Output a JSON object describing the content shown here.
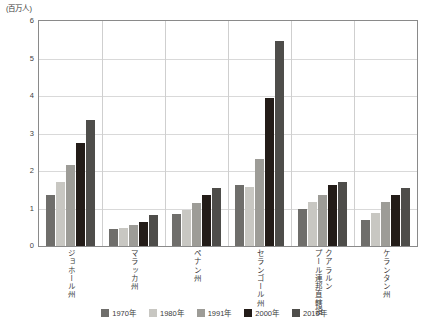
{
  "chart_data": {
    "type": "bar",
    "title": "",
    "subtitle": "",
    "unit_label": "(百万人)",
    "xlabel": "",
    "ylabel": "",
    "ylim": [
      0,
      6
    ],
    "yticks": [
      0,
      1,
      2,
      3,
      4,
      5,
      6
    ],
    "ytick_labels": [
      "0",
      "1",
      "2",
      "3",
      "4",
      "5",
      "6"
    ],
    "grid": true,
    "grid_axis": "y",
    "legend_position": "bottom",
    "categories": [
      "ジョホール州",
      "マラッカ州",
      "ペナン州",
      "セランゴール州",
      "クアラルンプール連邦直轄領",
      "ケランタン州"
    ],
    "category_columns": [
      [
        "ジョホール州"
      ],
      [
        "マラッカ州"
      ],
      [
        "ペナン州"
      ],
      [
        "セランゴール州"
      ],
      [
        "クアラルン",
        "プール連邦直轄領"
      ],
      [
        "ケランタン州"
      ]
    ],
    "series": [
      {
        "name": "1970年",
        "color": "#6f6e6b",
        "values": [
          1.35,
          0.45,
          0.85,
          1.63,
          1.0,
          0.7
        ]
      },
      {
        "name": "1980年",
        "color": "#c8c7c2",
        "values": [
          1.7,
          0.48,
          0.96,
          1.58,
          1.18,
          0.87
        ]
      },
      {
        "name": "1991年",
        "color": "#9d9c97",
        "values": [
          2.15,
          0.55,
          1.14,
          2.32,
          1.35,
          1.18
        ]
      },
      {
        "name": "2000年",
        "color": "#231c18",
        "values": [
          2.75,
          0.65,
          1.35,
          3.94,
          1.63,
          1.35
        ]
      },
      {
        "name": "2010年",
        "color": "#4e4d4a",
        "values": [
          3.35,
          0.82,
          1.56,
          5.46,
          1.72,
          1.54
        ]
      }
    ]
  },
  "colors": {
    "axis": "#8a8a8a",
    "grid": "#d9d9d9",
    "text": "#3a3a3a",
    "background": "#ffffff"
  }
}
